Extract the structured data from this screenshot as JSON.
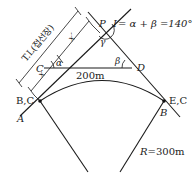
{
  "diagram": {
    "points": {
      "P": "P",
      "C": "C",
      "D": "D",
      "A": "A",
      "B": "B",
      "BC": "B,C",
      "EC": "E,C"
    },
    "angles": {
      "alpha": "α",
      "beta": "β",
      "gamma": "γ"
    },
    "formula": "I = α + β = 140°",
    "formula_parts": {
      "I": "I",
      "rest": "= α + β =140°"
    },
    "chord_length": "200m",
    "radius": {
      "R": "R",
      "value": "=300m"
    },
    "dimensions": {
      "tangent_length": "T.L(접선장)",
      "x": "x",
      "x_prime": "x′"
    }
  }
}
